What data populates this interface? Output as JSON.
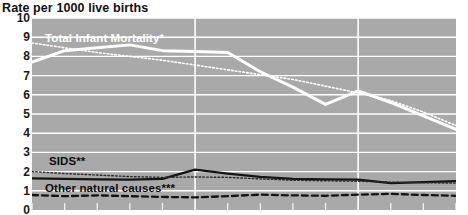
{
  "chart_data": {
    "type": "line",
    "title": "Rate per 1000 live births",
    "xlabel": "",
    "ylabel": "Rate per 1000 live births",
    "ylim": [
      0,
      10
    ],
    "yticks": [
      0,
      1,
      2,
      3,
      4,
      5,
      6,
      7,
      8,
      9,
      10
    ],
    "ytick_labels": [
      "0",
      "1",
      "2",
      "3",
      "4",
      "5",
      "6",
      "7",
      "8",
      "9",
      "10"
    ],
    "grid": true,
    "grid_color": "#ffffff",
    "plot_background": "#a9a9a9",
    "legend": "inline-annotations",
    "x": [
      0,
      1,
      2,
      3,
      4,
      5,
      6,
      7,
      8,
      9,
      10,
      11,
      12,
      13
    ],
    "xlim": [
      0,
      13
    ],
    "xtick_count": 14,
    "vertical_gridlines_at_x": [
      5,
      10
    ],
    "series": [
      {
        "name": "Total Infant Mortality*",
        "style": "solid",
        "color": "#ffffff",
        "width": 3.0,
        "values": [
          7.7,
          8.3,
          8.45,
          8.6,
          8.3,
          8.25,
          8.2,
          7.2,
          6.4,
          5.5,
          6.2,
          5.6,
          4.9,
          4.2
        ]
      },
      {
        "name": "Total Infant Mortality projected",
        "style": "dotted",
        "color": "#ffffff",
        "width": 1.6,
        "values": [
          8.7,
          8.45,
          8.2,
          8.0,
          7.8,
          7.55,
          7.3,
          7.05,
          6.8,
          6.45,
          6.1,
          5.7,
          5.1,
          4.4
        ]
      },
      {
        "name": "SIDS**",
        "style": "solid",
        "color": "#141414",
        "width": 2.3,
        "values": [
          1.65,
          1.62,
          1.6,
          1.58,
          1.62,
          2.1,
          1.9,
          1.72,
          1.62,
          1.6,
          1.58,
          1.4,
          1.45,
          1.5
        ]
      },
      {
        "name": "SIDS projected",
        "style": "dotted",
        "color": "#2a2a2a",
        "width": 1.4,
        "values": [
          2.0,
          1.9,
          1.82,
          1.74,
          1.7,
          1.72,
          1.7,
          1.62,
          1.55,
          1.52,
          1.5,
          1.45,
          1.42,
          1.4
        ]
      },
      {
        "name": "Other natural causes***",
        "style": "dashed",
        "color": "#141414",
        "width": 2.3,
        "values": [
          0.78,
          0.72,
          0.76,
          0.72,
          0.68,
          0.66,
          0.72,
          0.8,
          0.76,
          0.74,
          0.8,
          0.84,
          0.78,
          0.74
        ]
      }
    ],
    "annotations": [
      {
        "text": "Total Infant Mortality*",
        "color": "#ffffff"
      },
      {
        "text": "SIDS**",
        "color": "#0d0d0d"
      },
      {
        "text": "Other natural causes***",
        "color": "#0d0d0d"
      }
    ]
  },
  "labels": {
    "title": "Rate per 1000 live births",
    "total_infant_mortality": "Total Infant Mortality*",
    "sids": "SIDS**",
    "other_natural_causes": "Other natural causes***"
  }
}
